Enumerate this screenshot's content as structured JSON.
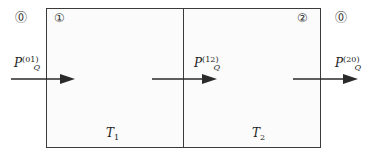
{
  "diagram": {
    "regions": [
      {
        "id": "0-left",
        "label": "⓪"
      },
      {
        "id": "1",
        "label": "①"
      },
      {
        "id": "2",
        "label": "②"
      },
      {
        "id": "0-right",
        "label": "⓪"
      }
    ],
    "compartments": [
      {
        "name": "T",
        "subscript": "1"
      },
      {
        "name": "T",
        "subscript": "2"
      }
    ],
    "flows": [
      {
        "name": "P",
        "subscript": "Q",
        "superscript": "(01)"
      },
      {
        "name": "P",
        "subscript": "Q",
        "superscript": "(12)"
      },
      {
        "name": "P",
        "subscript": "Q",
        "superscript": "(20)"
      }
    ],
    "colors": {
      "stroke": "#3a3a3a",
      "fill": "#fbfbfb",
      "arrow": "#2a2a2a"
    }
  }
}
